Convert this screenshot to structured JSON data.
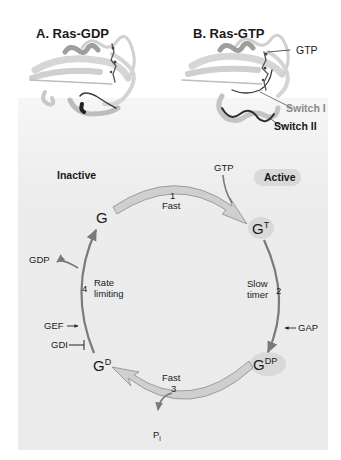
{
  "figure": {
    "panel_a": {
      "title": "A. Ras-GDP"
    },
    "panel_b": {
      "title": "B. Ras-GTP",
      "labels": {
        "gtp": "GTP",
        "switch1": "Switch I",
        "switch2": "Switch II"
      }
    },
    "cycle": {
      "inactive_label": "Inactive",
      "active_label": "Active",
      "states": {
        "g": {
          "base": "G",
          "sup": ""
        },
        "gt": {
          "base": "G",
          "sup": "T"
        },
        "gdp": {
          "base": "G",
          "sup": "DP"
        },
        "gd": {
          "base": "G",
          "sup": "D"
        }
      },
      "steps": [
        {
          "number": "1",
          "label": "Fast"
        },
        {
          "number": "2",
          "label_line1": "Slow",
          "label_line2": "timer"
        },
        {
          "number": "3",
          "label": "Fast"
        },
        {
          "number": "4",
          "label_line1": "Rate",
          "label_line2": "limiting"
        }
      ],
      "inputs": {
        "gtp": "GTP",
        "gdp_out": "GDP",
        "pi": "P",
        "pi_sub": "i",
        "gap": "GAP",
        "gef": "GEF",
        "gdi": "GDI"
      }
    },
    "colors": {
      "arc_fill": "#cfcfcf",
      "arc_stroke": "#8c8c8c",
      "thin_arrow": "#7a7a7a",
      "badge": "#d9d9d9",
      "switch1_text": "#8a8a8a",
      "panel_bg": "#ececec"
    }
  }
}
